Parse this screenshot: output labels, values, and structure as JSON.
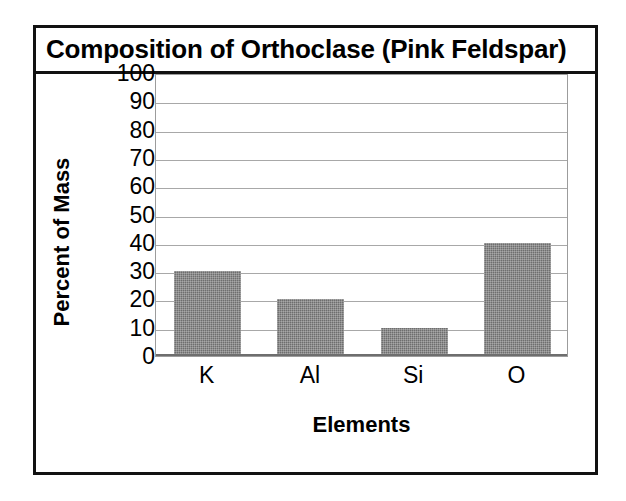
{
  "chart_data": {
    "type": "bar",
    "title": "Composition of Orthoclase (Pink Feldspar)",
    "categories": [
      "K",
      "Al",
      "Si",
      "O"
    ],
    "values": [
      30,
      20,
      10,
      40
    ],
    "xlabel": "Elements",
    "ylabel": "Percent of Mass",
    "ylim": [
      0,
      100
    ],
    "ytick_step": 10,
    "yticks": [
      "100",
      "90",
      "80",
      "70",
      "60",
      "50",
      "40",
      "30",
      "20",
      "10",
      "0"
    ],
    "grid": true,
    "legend": "none",
    "bar_color": "#6e6e6e",
    "gridline_color": "#a8a8a8",
    "frame_color": "#111111",
    "background_color": "#ffffff"
  }
}
